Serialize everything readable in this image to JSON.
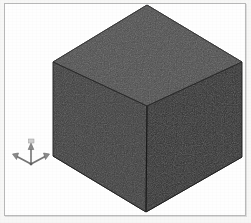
{
  "viewport": {
    "name": "3d-model-viewport",
    "width": 251,
    "height": 223,
    "background_color": "#fefefe",
    "border_color": "#b9b9b9",
    "page_background": "#f7f7f6"
  },
  "model": {
    "shape_name": "cube",
    "projection": "isometric",
    "faces": [
      {
        "name": "top-face",
        "color": "#4b4b4b",
        "points": "147,5 242,62 147,106 53,62"
      },
      {
        "name": "left-face",
        "color": "#3b3b3b",
        "points": "53,62 147,106 146,212 53,156"
      },
      {
        "name": "right-face",
        "color": "#2d2d2d",
        "points": "147,106 242,62 242,157 146,212"
      }
    ],
    "edge_color": "#1f1f1f",
    "vertices": {
      "top": "147,5",
      "left": "53,62",
      "right": "242,62",
      "front_top": "147,106",
      "bottom": "146,212",
      "left_bottom": "53,156",
      "right_bottom": "242,157"
    }
  },
  "axis_gizmo": {
    "name": "axis-triad-indicator",
    "origin_x": 31,
    "origin_y": 163,
    "color": "#6f6f6f",
    "axes": [
      {
        "name": "z-axis",
        "label": "Z",
        "direction": "up",
        "tip_x": 31,
        "tip_y": 146
      },
      {
        "name": "x-axis",
        "label": "X",
        "direction": "down-left",
        "tip_x": 14,
        "tip_y": 155
      },
      {
        "name": "y-axis",
        "label": "Y",
        "direction": "down-right",
        "tip_x": 48,
        "tip_y": 155
      }
    ]
  }
}
